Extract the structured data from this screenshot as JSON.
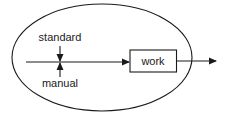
{
  "diagram": {
    "boundary": {
      "shape": "ellipse"
    },
    "inputs": {
      "top": {
        "label": "standard"
      },
      "bottom": {
        "label": "manual"
      }
    },
    "process": {
      "label": "work"
    },
    "colors": {
      "stroke": "#1a1a1a",
      "background": "#ffffff"
    }
  }
}
